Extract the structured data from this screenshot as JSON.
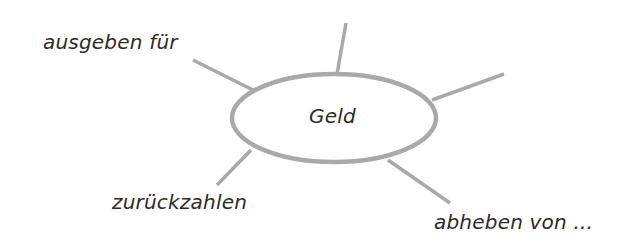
{
  "diagram": {
    "type": "mind-map",
    "center": {
      "label": "Geld"
    },
    "branches": [
      {
        "id": "top-left",
        "label": "ausgeben für"
      },
      {
        "id": "top",
        "label": ""
      },
      {
        "id": "top-right",
        "label": ""
      },
      {
        "id": "bottom-left",
        "label": "zurückzahlen"
      },
      {
        "id": "bottom-right",
        "label": "abheben von ..."
      }
    ],
    "colors": {
      "line": "#a9a9a9",
      "text": "#2b2b2b",
      "background": "#ffffff"
    }
  }
}
